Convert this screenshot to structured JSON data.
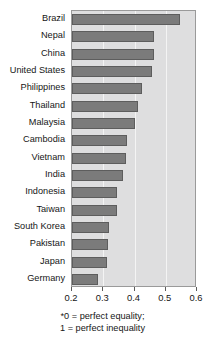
{
  "chart_data": {
    "type": "bar",
    "orientation": "horizontal",
    "title": "",
    "xlabel": "",
    "ylabel": "",
    "xlim": [
      0.2,
      0.6
    ],
    "xticks": [
      "0.2",
      "0.3",
      "0.4",
      "0.5",
      "0.6"
    ],
    "grid": true,
    "legend": null,
    "categories": [
      "Brazil",
      "Nepal",
      "China",
      "United States",
      "Philippines",
      "Thailand",
      "Malaysia",
      "Cambodia",
      "Vietnam",
      "India",
      "Indonesia",
      "Taiwan",
      "South Korea",
      "Pakistan",
      "Japan",
      "Germany"
    ],
    "values": [
      0.545,
      0.462,
      0.462,
      0.455,
      0.425,
      0.41,
      0.4,
      0.375,
      0.372,
      0.362,
      0.345,
      0.343,
      0.318,
      0.315,
      0.312,
      0.282
    ],
    "annotations": [
      "*0 = perfect equality;",
      "1 = perfect inequality"
    ],
    "colors": {
      "bar_fill": "#7b7b7b",
      "bar_edge": "#5d5d5d",
      "plot_background": "#dededf",
      "gridline": "#f4f4f4",
      "axis": "#9a9a9a",
      "text": "#161616"
    }
  }
}
